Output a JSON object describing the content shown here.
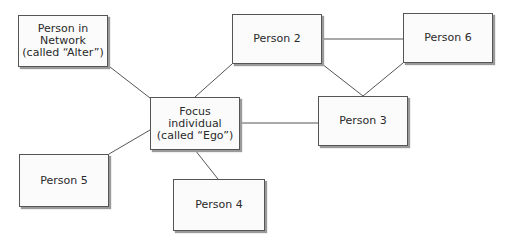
{
  "diagram": {
    "type": "social-network",
    "nodes": [
      {
        "id": "alter",
        "label": "Person in\nNetwork\n(called “Alter”)",
        "x": 18,
        "y": 15,
        "w": 90,
        "h": 52
      },
      {
        "id": "p2",
        "label": "Person 2",
        "x": 232,
        "y": 14,
        "w": 90,
        "h": 50
      },
      {
        "id": "p6",
        "label": "Person 6",
        "x": 403,
        "y": 13,
        "w": 90,
        "h": 50
      },
      {
        "id": "ego",
        "label": "Focus individual\n(called “Ego”)",
        "x": 150,
        "y": 97,
        "w": 90,
        "h": 53
      },
      {
        "id": "p3",
        "label": "Person 3",
        "x": 318,
        "y": 96,
        "w": 90,
        "h": 50
      },
      {
        "id": "p5",
        "label": "Person 5",
        "x": 19,
        "y": 154,
        "w": 90,
        "h": 53
      },
      {
        "id": "p4",
        "label": "Person 4",
        "x": 173,
        "y": 179,
        "w": 92,
        "h": 52
      }
    ],
    "edges": [
      {
        "from": "alter",
        "to": "ego",
        "x1": 110,
        "y1": 67,
        "x2": 150,
        "y2": 98
      },
      {
        "from": "ego",
        "to": "p2",
        "x1": 195,
        "y1": 97,
        "x2": 232,
        "y2": 64
      },
      {
        "from": "p2",
        "to": "p6",
        "x1": 322,
        "y1": 39,
        "x2": 403,
        "y2": 39
      },
      {
        "from": "p2",
        "to": "p3",
        "x1": 322,
        "y1": 64,
        "x2": 363,
        "y2": 96
      },
      {
        "from": "p6",
        "to": "p3",
        "x1": 403,
        "y1": 63,
        "x2": 363,
        "y2": 96
      },
      {
        "from": "ego",
        "to": "p3",
        "x1": 240,
        "y1": 123,
        "x2": 318,
        "y2": 123
      },
      {
        "from": "ego",
        "to": "p5",
        "x1": 150,
        "y1": 130,
        "x2": 109,
        "y2": 154
      },
      {
        "from": "ego",
        "to": "p4",
        "x1": 195,
        "y1": 150,
        "x2": 218,
        "y2": 179
      }
    ],
    "colors": {
      "line": "#555555",
      "box_border": "#555555",
      "box_fill": "#fbfbfb",
      "text": "#2a2a2a"
    }
  }
}
